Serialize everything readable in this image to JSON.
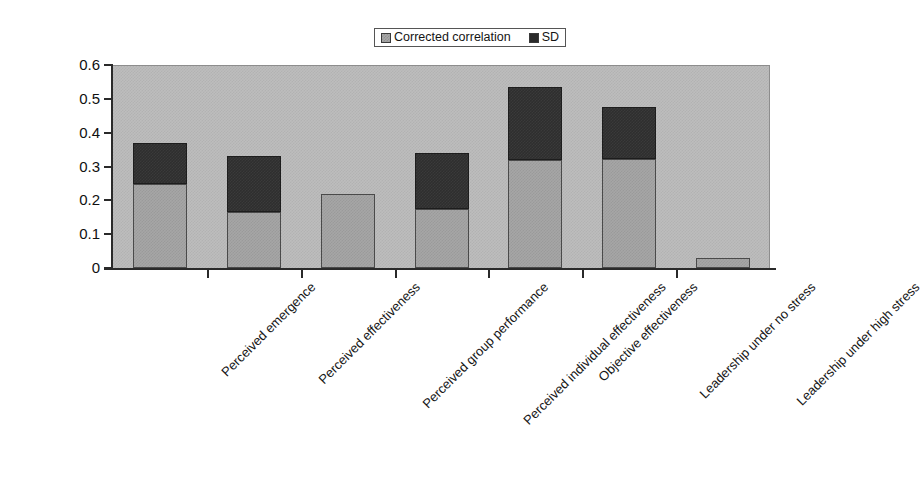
{
  "chart_data": {
    "type": "bar",
    "stacked": true,
    "title": "",
    "xlabel": "",
    "ylabel": "",
    "ylim": [
      0,
      0.6
    ],
    "ytick_labels": [
      "0.6",
      "0.5",
      "0.4",
      "0.3",
      "0.2",
      "0.1",
      "0"
    ],
    "ytick_values": [
      0.6,
      0.5,
      0.4,
      0.3,
      0.2,
      0.1,
      0
    ],
    "grid": false,
    "legend_position": "top",
    "plot_background_color": "#bdbdbd",
    "categories": [
      "Perceived emergence",
      "Perceived effectiveness",
      "Perceived group performance",
      "Perceived individual effectiveness",
      "Objective effectiveness",
      "Leadership under no stress",
      "Leadership under high stress"
    ],
    "series": [
      {
        "name": "Corrected correlation",
        "color": "#a6a6a6",
        "values": [
          0.25,
          0.165,
          0.22,
          0.175,
          0.32,
          0.32,
          0.03
        ]
      },
      {
        "name": "SD",
        "color": "#2e2e2e",
        "values": [
          0.12,
          0.165,
          0.0,
          0.165,
          0.215,
          0.155,
          0.0
        ]
      }
    ],
    "totals": [
      0.37,
      0.33,
      0.22,
      0.34,
      0.535,
      0.475,
      0.03
    ]
  },
  "legend": {
    "entries": [
      {
        "label": "Corrected correlation",
        "swatch": "series-corrected"
      },
      {
        "label": "SD",
        "swatch": "series-sd"
      }
    ]
  }
}
